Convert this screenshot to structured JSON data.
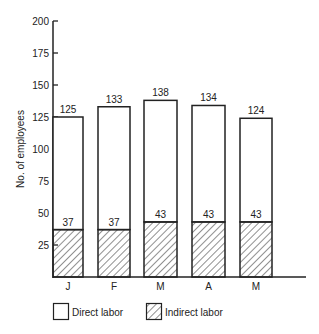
{
  "chart_data": {
    "type": "bar",
    "stacked": true,
    "title": "",
    "xlabel": "",
    "ylabel": "No. of employees",
    "ylim": [
      0,
      200
    ],
    "yticks": [
      25,
      50,
      75,
      100,
      125,
      150,
      175,
      200
    ],
    "grid": false,
    "categories": [
      "J",
      "F",
      "M",
      "A",
      "M"
    ],
    "totals": [
      125,
      133,
      138,
      134,
      124
    ],
    "series": [
      {
        "name": "Indirect labor",
        "pattern": "hatched",
        "values": [
          37,
          37,
          43,
          43,
          43
        ]
      },
      {
        "name": "Direct labor",
        "pattern": "white",
        "values": [
          88,
          96,
          95,
          91,
          81
        ]
      }
    ],
    "bar_labels_indirect": [
      37,
      37,
      43,
      43,
      43
    ],
    "bar_labels_total": [
      125,
      133,
      138,
      134,
      124
    ],
    "legend": {
      "position": "bottom",
      "items": [
        {
          "label": "Direct labor",
          "pattern": "white"
        },
        {
          "label": "Indirect labor",
          "pattern": "hatched"
        }
      ]
    }
  },
  "colors": {
    "ink": "#222222",
    "background": "#ffffff"
  }
}
